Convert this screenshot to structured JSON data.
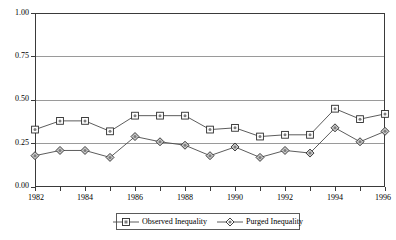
{
  "chart_data": {
    "type": "line",
    "title": "",
    "subtitle": "",
    "xlabel": "",
    "ylabel": "",
    "x": [
      1982,
      1983,
      1984,
      1985,
      1986,
      1987,
      1988,
      1989,
      1990,
      1991,
      1992,
      1993,
      1994,
      1995,
      1996
    ],
    "xlim": [
      1982,
      1996
    ],
    "ylim": [
      0.0,
      1.0
    ],
    "y_ticks": [
      0.0,
      0.25,
      0.5,
      0.75,
      1.0
    ],
    "y_tick_labels": [
      "0.00",
      "0.25",
      "0.50",
      "0.75",
      "1.00"
    ],
    "x_ticks": [
      1982,
      1983,
      1984,
      1985,
      1986,
      1987,
      1988,
      1989,
      1990,
      1991,
      1992,
      1993,
      1994,
      1995,
      1996
    ],
    "x_tick_labels": [
      "1982",
      "",
      "1984",
      "",
      "1986",
      "",
      "1988",
      "",
      "1990",
      "",
      "1992",
      "",
      "1994",
      "",
      "1996"
    ],
    "grid": "horizontal",
    "legend_position": "bottom-center",
    "series": [
      {
        "name": "Observed Inequality",
        "marker": "square",
        "values": [
          0.33,
          0.38,
          0.38,
          0.32,
          0.41,
          0.41,
          0.41,
          0.33,
          0.34,
          0.29,
          0.3,
          0.3,
          0.45,
          0.39,
          0.42
        ]
      },
      {
        "name": "Purged Inequality",
        "marker": "diamond",
        "values": [
          0.18,
          0.21,
          0.21,
          0.17,
          0.29,
          0.26,
          0.24,
          0.18,
          0.23,
          0.17,
          0.21,
          0.195,
          0.34,
          0.26,
          0.32
        ]
      }
    ],
    "colors": {
      "line": "#4a4a4a",
      "marker_square_fill": "#ffffff",
      "marker_diamond_fill": "#c9c9c9",
      "marker_stroke": "#2b2b2b",
      "grid": "#9a9a9a",
      "frame": "#3a3a3a",
      "background": "#ffffff"
    }
  },
  "legend": {
    "items": [
      {
        "label": "Observed Inequality"
      },
      {
        "label": "Purged Inequality"
      }
    ]
  }
}
